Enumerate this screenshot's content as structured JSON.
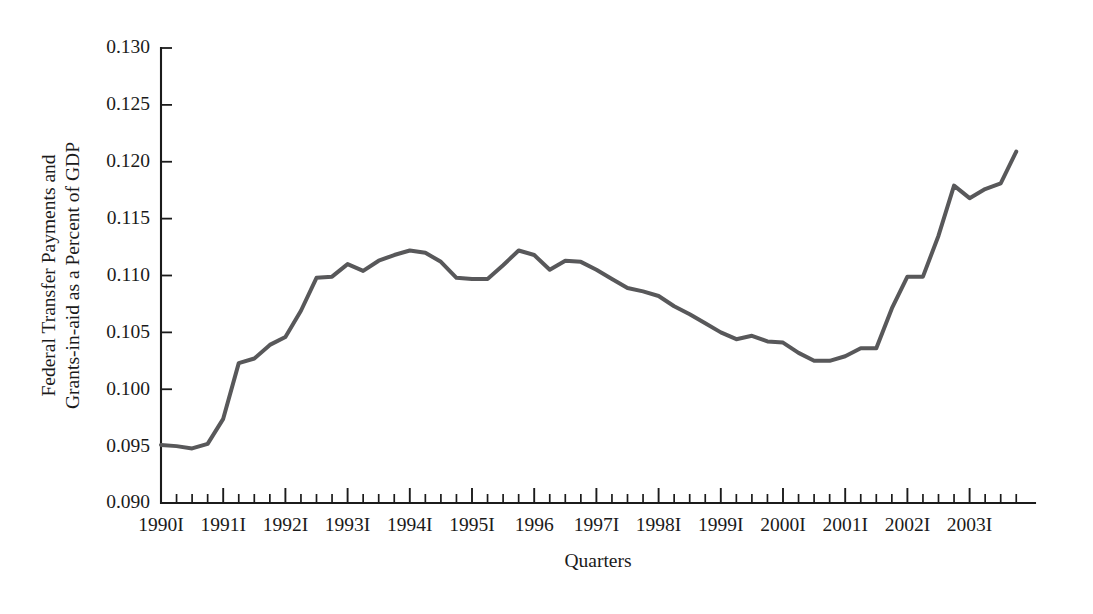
{
  "chart_data": {
    "type": "line",
    "title": "",
    "subtitle": "",
    "xlabel": "Quarters",
    "ylabel": "Federal Transfer Payments and Grants-in-aid as a Percent of GDP",
    "ylabel_line1": "Federal Transfer Payments and",
    "ylabel_line2": "Grants-in-aid as a Percent of GDP",
    "ylim": [
      0.09,
      0.13
    ],
    "ytick_labels": [
      "0.130",
      "0.125",
      "0.120",
      "0.115",
      "0.110",
      "0.105",
      "0.100",
      "0.095",
      "0.090"
    ],
    "ytick_values": [
      0.13,
      0.125,
      0.12,
      0.115,
      0.11,
      0.105,
      0.1,
      0.095,
      0.09
    ],
    "xtick_labels": [
      "1990I",
      "1991I",
      "1992I",
      "1993I",
      "1994I",
      "1995I",
      "1996",
      "1997I",
      "1998I",
      "1999I",
      "2000I",
      "2001I",
      "2002I",
      "2003I"
    ],
    "xtick_years": [
      1990,
      1991,
      1992,
      1993,
      1994,
      1995,
      1996,
      1997,
      1998,
      1999,
      2000,
      2001,
      2002,
      2003
    ],
    "grid": false,
    "legend": null,
    "legend_position": "none",
    "line_color": "#58585a",
    "axis_color": "#1b1b1b",
    "background_color": "#ffffff",
    "x_quarters": [
      "1990I",
      "1990II",
      "1990III",
      "1990IV",
      "1991I",
      "1991II",
      "1991III",
      "1991IV",
      "1992I",
      "1992II",
      "1992III",
      "1992IV",
      "1993I",
      "1993II",
      "1993III",
      "1993IV",
      "1994I",
      "1994II",
      "1994III",
      "1994IV",
      "1995I",
      "1995II",
      "1995III",
      "1995IV",
      "1996I",
      "1996II",
      "1996III",
      "1996IV",
      "1997I",
      "1997II",
      "1997III",
      "1997IV",
      "1998I",
      "1998II",
      "1998III",
      "1998IV",
      "1999I",
      "1999II",
      "1999III",
      "1999IV",
      "2000I",
      "2000II",
      "2000III",
      "2000IV",
      "2001I",
      "2001II",
      "2001III",
      "2001IV",
      "2002I",
      "2002II",
      "2002III",
      "2002IV",
      "2003I"
    ],
    "values": [
      0.0951,
      0.095,
      0.0948,
      0.0952,
      0.0974,
      0.1023,
      0.1027,
      0.1039,
      0.1046,
      0.1069,
      0.1098,
      0.1099,
      0.111,
      0.1104,
      0.1113,
      0.1118,
      0.1122,
      0.112,
      0.1112,
      0.1098,
      0.1097,
      0.1097,
      0.1109,
      0.1122,
      0.1118,
      0.1105,
      0.1113,
      0.1112,
      0.1105,
      0.1097,
      0.1089,
      0.1086,
      0.1082,
      0.1073,
      0.1066,
      0.1058,
      0.105,
      0.1044,
      0.1047,
      0.1042,
      0.1041,
      0.1032,
      0.1025,
      0.1025,
      0.1029,
      0.1036,
      0.1036,
      0.1071,
      0.1099,
      0.1099,
      0.1135,
      0.1179,
      0.1168,
      0.1176,
      0.1181,
      0.1209
    ]
  }
}
